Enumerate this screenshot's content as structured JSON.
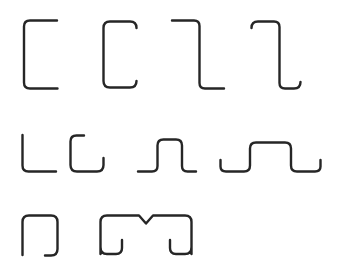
{
  "page": {
    "background_color": "#ffffff",
    "width": 339,
    "height": 273
  },
  "drawing": {
    "stroke_color": "#262626",
    "stroke_width": 2.4,
    "fill": "none",
    "line_cap": "round",
    "line_join": "round",
    "style": "line-drawing",
    "rows": 3,
    "shape_count": 10
  },
  "shapes": [
    {
      "id": "plain-channel",
      "name": "Plain C channel",
      "row": 1,
      "column": 1,
      "bbox": [
        24,
        20,
        57,
        89
      ],
      "path": "M 57 20.5 L 30 20.5 Q 24 20.5 24 26.5 L 24 82.5 Q 24 88.5 30 88.5 L 57.5 88.5"
    },
    {
      "id": "lipped-channel",
      "name": "Lipped C channel",
      "row": 1,
      "column": 2,
      "bbox": [
        103,
        21,
        137,
        88
      ],
      "path": "M 136.5 28 Q 136.5 21.5 130 21.5 L 110 21.5 Q 103.5 21.5 103.5 28 L 103.5 81 Q 103.5 87.5 110 87.5 L 130 87.5 Q 136.5 87.5 136.5 81"
    },
    {
      "id": "plain-zed",
      "name": "Plain Z section",
      "row": 1,
      "column": 3,
      "bbox": [
        172,
        20,
        224,
        89
      ],
      "path": "M 172 20.5 L 194 20.5 Q 199.5 20.5 199.5 26 L 199.5 83 Q 199.5 88.5 205 88.5 L 224 88.5"
    },
    {
      "id": "lipped-zed",
      "name": "Lipped Z section",
      "row": 1,
      "column": 4,
      "bbox": [
        251,
        21,
        301,
        89
      ],
      "path": "M 251.5 28 Q 251.5 21.5 258 21.5 L 274 21.5 Q 279.5 21.5 279.5 27 L 279.5 83 Q 279.5 88.5 285 88.5 L 294 88.5 Q 300.5 88.5 300.5 82"
    },
    {
      "id": "plain-angle",
      "name": "Plain L angle",
      "row": 2,
      "column": 1,
      "bbox": [
        22,
        135,
        56,
        172
      ],
      "path": "M 22.5 135 L 22.5 165.5 Q 22.5 171.5 28.5 171.5 L 56 171.5"
    },
    {
      "id": "lipped-channel-short",
      "name": "Short lipped C channel",
      "row": 2,
      "column": 2,
      "bbox": [
        70,
        135,
        104,
        172
      ],
      "path": "M 84 135.5 L 76.5 135.5 Q 70.5 135.5 70.5 141.5 L 70.5 165 Q 70.5 171.5 77 171.5 L 97 171.5 Q 103.5 171.5 103.5 165 L 103.5 158"
    },
    {
      "id": "plain-hat",
      "name": "Plain hat section",
      "row": 2,
      "column": 3,
      "bbox": [
        138,
        139,
        196,
        172
      ],
      "path": "M 138 171.5 L 152 171.5 Q 157.5 171.5 157.5 166 L 157.5 145.5 Q 157.5 139.5 163.5 139.5 L 176 139.5 Q 182 139.5 182 145.5 L 182 166 Q 182 171.5 187.5 171.5 L 196 171.5"
    },
    {
      "id": "lipped-hat",
      "name": "Lipped hat section",
      "row": 2,
      "column": 4,
      "bbox": [
        220,
        142,
        321,
        172
      ],
      "path": "M 220.5 160 L 220.5 166.5 Q 220.5 171.5 226 171.5 L 244 171.5 Q 250 171.5 250 165.5 L 250 148.5 Q 250 142.5 256 142.5 L 285 142.5 Q 291 142.5 291 148.5 L 291 165.5 Q 291 171.5 297 171.5 L 315 171.5 Q 320.5 171.5 320.5 166.5 L 320.5 160"
    },
    {
      "id": "lipped-u-channel",
      "name": "Inverted lipped U channel",
      "row": 3,
      "column": 1,
      "bbox": [
        22,
        215,
        58,
        256
      ],
      "path": "M 22.5 255 L 22.5 222 Q 22.5 215.5 29 215.5 L 51 215.5 Q 57.5 215.5 57.5 222 L 57.5 249 Q 57.5 255.5 51 255.5 L 45 255.5"
    },
    {
      "id": "double-u-notched",
      "name": "Back-to-back lipped U with V notch",
      "row": 3,
      "column": 2,
      "bbox": [
        100,
        215,
        192,
        256
      ],
      "path": "M 100.5 254 L 100.5 222 Q 100.5 215.5 107 215.5 L 139 215.5 L 146 223.5 L 153 215.5 L 185 215.5 Q 191.5 215.5 191.5 222 L 191.5 254 M 100.5 247 Q 100.5 254 107 254 L 116 254 Q 122 254 122 248 L 122 240 M 191.5 247 Q 191.5 254 185 254 L 176 254 Q 170 254 170 248 L 170 240"
    }
  ]
}
